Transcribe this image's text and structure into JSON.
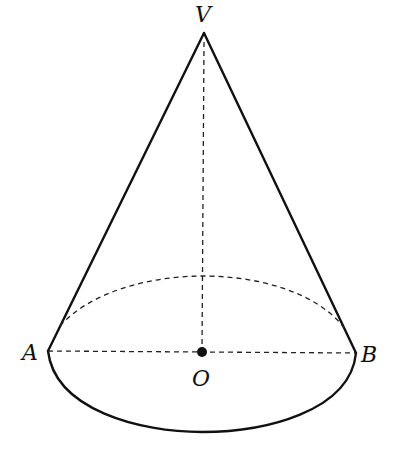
{
  "diagram": {
    "labels": {
      "apex": "V",
      "left": "A",
      "right": "B",
      "center": "O"
    },
    "points": {
      "V": [
        204,
        33
      ],
      "A": [
        48,
        351
      ],
      "B": [
        356,
        353
      ],
      "O": [
        202,
        352
      ]
    },
    "colors": {
      "stroke": "#111111",
      "background": "#ffffff"
    }
  }
}
